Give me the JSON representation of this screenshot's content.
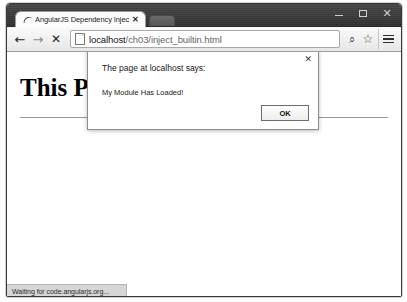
{
  "window": {
    "controls": {
      "minimize_label": "—",
      "maximize_label": "□",
      "close_label": "✕"
    }
  },
  "tabs": [
    {
      "title": "AngularJS Dependency Injec",
      "close_label": "✕",
      "favicon": "angularjs-favicon",
      "active": true
    }
  ],
  "new_tab": {
    "label": ""
  },
  "toolbar": {
    "back_label": "←",
    "forward_label": "→",
    "stop_label": "✕",
    "search_icon_label": "⌕",
    "star_icon_label": "☆",
    "menu_label": ""
  },
  "address_bar": {
    "host": "localhost",
    "path": "/ch03/inject_builtin.html",
    "full_url": "localhost/ch03/inject_builtin.html",
    "placeholder": "Search Google or type URL"
  },
  "page": {
    "heading": "This Pa",
    "heading_full": "This Page Has Loaded"
  },
  "dialog": {
    "title": "The page at localhost says:",
    "message": "My Module Has Loaded!",
    "ok_label": "OK",
    "close_label": "✕"
  },
  "status": {
    "text": "Waiting for code.angularjs.org..."
  },
  "colors": {
    "titlebar": "#3b3b3b",
    "toolbar": "#e7e7e7",
    "page_background": "#ffffff",
    "status_background": "#d6d6d6",
    "dialog_border": "#8e8e8e"
  }
}
